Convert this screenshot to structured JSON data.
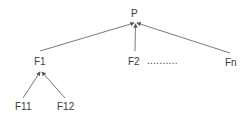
{
  "diagram": {
    "type": "tree",
    "colors": {
      "line": "#6a6a6a",
      "text": "#3a3a3a",
      "background": "#ffffff"
    },
    "nodes": {
      "root": {
        "label": "P"
      },
      "f1": {
        "label": "F1"
      },
      "f2": {
        "label": "F2"
      },
      "fn": {
        "label": "Fn"
      },
      "f11": {
        "label": "F11"
      },
      "f12": {
        "label": "F12"
      }
    },
    "ellipsis": "..........",
    "edges": [
      {
        "from": "F1",
        "to": "P"
      },
      {
        "from": "F2",
        "to": "P"
      },
      {
        "from": "Fn",
        "to": "P"
      },
      {
        "from": "F11",
        "to": "F1"
      },
      {
        "from": "F12",
        "to": "F1"
      }
    ]
  }
}
